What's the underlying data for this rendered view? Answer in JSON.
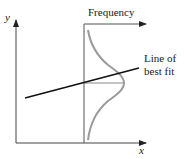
{
  "diagram": {
    "type": "regression-error-distribution",
    "axes": {
      "x_label": "x",
      "y_label": "y",
      "frequency_label": "Frequency"
    },
    "annotations": {
      "line_label_line1": "Line of",
      "line_label_line2": "best fit"
    },
    "colors": {
      "axis": "#333333",
      "regression_line": "#111111",
      "curve": "#9a9a9a",
      "mean_line": "#8a8a8a"
    }
  }
}
